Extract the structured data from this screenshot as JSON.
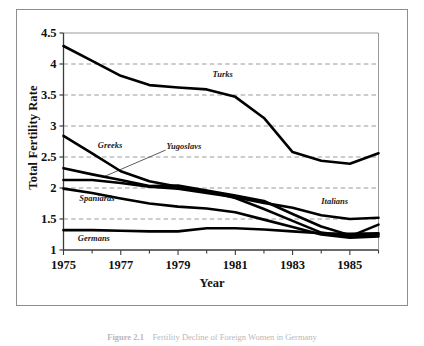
{
  "figure": {
    "caption_label": "Figure 2.1",
    "caption_text": "Fertility Decline of Foreign Women in Germany"
  },
  "chart_data": {
    "type": "line",
    "title": "",
    "xlabel": "Year",
    "ylabel": "Total Fertility Rate",
    "xlim": [
      1975,
      1986
    ],
    "ylim": [
      1,
      4.5
    ],
    "yticks": [
      "1",
      "1.5",
      "2",
      "2.5",
      "3",
      "3.5",
      "4",
      "4.5"
    ],
    "ytick_values": [
      1,
      1.5,
      2,
      2.5,
      3,
      3.5,
      4,
      4.5
    ],
    "xticks": [
      "1975",
      "1977",
      "1979",
      "1981",
      "1983",
      "1985"
    ],
    "xtick_values": [
      1975,
      1977,
      1979,
      1981,
      1983,
      1985
    ],
    "x_minor_ticks": [
      1975,
      1976,
      1977,
      1978,
      1979,
      1980,
      1981,
      1982,
      1983,
      1984,
      1985,
      1986
    ],
    "grid": "horizontal-dashed",
    "legend": "inline-annotations",
    "x": [
      1975,
      1976,
      1977,
      1978,
      1979,
      1980,
      1981,
      1982,
      1983,
      1984,
      1985,
      1986
    ],
    "series": [
      {
        "name": "Turks",
        "label": "Turks",
        "color": "#000000",
        "values": [
          4.29,
          4.05,
          3.81,
          3.66,
          3.62,
          3.59,
          3.47,
          3.13,
          2.58,
          2.44,
          2.39,
          2.56
        ]
      },
      {
        "name": "Greeks",
        "label": "Greeks",
        "color": "#000000",
        "values": [
          2.84,
          2.56,
          2.27,
          2.11,
          2.02,
          1.95,
          1.84,
          1.66,
          1.47,
          1.28,
          1.22,
          1.41
        ]
      },
      {
        "name": "Yugoslavs",
        "label": "Yugoslavs",
        "color": "#000000",
        "values": [
          2.32,
          2.22,
          2.13,
          2.03,
          2.04,
          1.96,
          1.88,
          1.79,
          1.58,
          1.38,
          1.24,
          1.25
        ]
      },
      {
        "name": "Italians",
        "label": "Italians",
        "color": "#000000",
        "values": [
          2.13,
          2.13,
          2.08,
          2.02,
          1.99,
          1.92,
          1.85,
          1.76,
          1.68,
          1.56,
          1.5,
          1.52
        ]
      },
      {
        "name": "Spaniards",
        "label": "Spaniards",
        "color": "#000000",
        "values": [
          1.99,
          1.92,
          1.83,
          1.75,
          1.7,
          1.67,
          1.61,
          1.49,
          1.37,
          1.25,
          1.2,
          1.22
        ]
      },
      {
        "name": "Germans",
        "label": "Germans",
        "color": "#000000",
        "values": [
          1.32,
          1.32,
          1.31,
          1.3,
          1.3,
          1.35,
          1.35,
          1.33,
          1.3,
          1.27,
          1.26,
          1.27
        ]
      }
    ],
    "annotations": [
      {
        "text": "Turks",
        "x": 1980.2,
        "y": 3.83
      },
      {
        "text": "Greeks",
        "x": 1976.2,
        "y": 2.67
      },
      {
        "text": "Yugoslavs",
        "x": 1978.6,
        "y": 2.66,
        "leader_to_x": 1976.35,
        "leader_to_y": 2.17
      },
      {
        "text": "Spaniards",
        "x": 1975.55,
        "y": 1.82
      },
      {
        "text": "Germans",
        "x": 1975.5,
        "y": 1.18
      },
      {
        "text": "Italians",
        "x": 1984.0,
        "y": 1.77
      }
    ]
  }
}
